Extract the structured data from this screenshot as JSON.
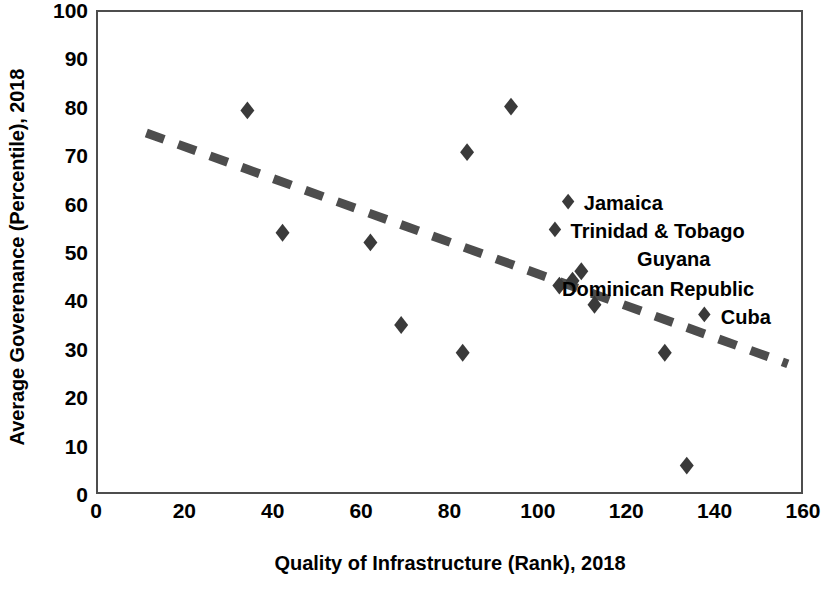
{
  "chart_data": {
    "type": "scatter",
    "title": "",
    "xlabel": "Quality of Infrastructure (Rank), 2018",
    "ylabel": "Average Goverenance (Percentile), 2018",
    "xlim": [
      0,
      160
    ],
    "ylim": [
      0,
      100
    ],
    "xticks": [
      0,
      20,
      40,
      60,
      80,
      100,
      120,
      140,
      160
    ],
    "yticks": [
      0,
      10,
      20,
      30,
      40,
      50,
      60,
      70,
      80,
      90,
      100
    ],
    "grid": false,
    "legend": "none",
    "marker": "diamond",
    "marker_color": "#3a3a3a",
    "points": [
      {
        "x": 34,
        "y": 79.5,
        "label": ""
      },
      {
        "x": 42,
        "y": 54,
        "label": ""
      },
      {
        "x": 62,
        "y": 52,
        "label": ""
      },
      {
        "x": 69,
        "y": 34.8,
        "label": ""
      },
      {
        "x": 83,
        "y": 29,
        "label": ""
      },
      {
        "x": 84,
        "y": 70.8,
        "label": ""
      },
      {
        "x": 94,
        "y": 80.3,
        "label": ""
      },
      {
        "x": 105,
        "y": 43,
        "label": ""
      },
      {
        "x": 108,
        "y": 44,
        "label": ""
      },
      {
        "x": 110,
        "y": 46,
        "label": ""
      },
      {
        "x": 113,
        "y": 39,
        "label": ""
      },
      {
        "x": 129,
        "y": 29,
        "label": ""
      },
      {
        "x": 134,
        "y": 5.5,
        "label": ""
      }
    ],
    "annotations": [
      {
        "text": "Jamaica",
        "x": 107,
        "y": 60.5,
        "marker": true
      },
      {
        "text": "Trinidad & Tobago",
        "x": 104,
        "y": 54.7,
        "marker": true
      },
      {
        "text": "Guyana",
        "x": 122,
        "y": 49,
        "marker": false
      },
      {
        "text": "Dominican Republic",
        "x": 105,
        "y": 42.8,
        "marker": false
      },
      {
        "text": "Cuba",
        "x": 138,
        "y": 37,
        "marker": true
      }
    ],
    "trendline": {
      "type": "dashed",
      "color": "#4d4d4d",
      "x0": 11,
      "y0": 74.8,
      "x1": 157,
      "y1": 26.7
    }
  },
  "axes": {
    "y_title": "Average Goverenance (Percentile), 2018",
    "x_title": "Quality of Infrastructure (Rank), 2018"
  }
}
